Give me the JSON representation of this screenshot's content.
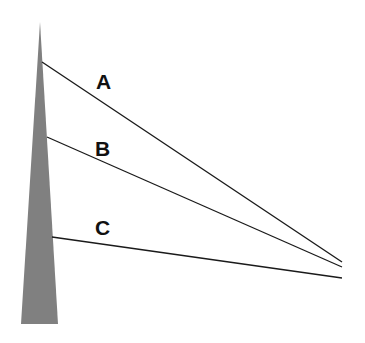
{
  "diagram": {
    "pole": {
      "color": "#808080",
      "top": [
        40,
        22
      ],
      "base_left": [
        21,
        324
      ],
      "base_right": [
        58,
        324
      ]
    },
    "lines": [
      {
        "label": "A",
        "start": [
          42,
          62
        ],
        "end": [
          342,
          262
        ],
        "label_pos": [
          96,
          89
        ]
      },
      {
        "label": "B",
        "start": [
          47,
          137
        ],
        "end": [
          342,
          267
        ],
        "label_pos": [
          95,
          156
        ]
      },
      {
        "label": "C",
        "start": [
          52,
          237
        ],
        "end": [
          342,
          278
        ],
        "label_pos": [
          95,
          235
        ]
      }
    ],
    "line_color": "#1a1a1a"
  }
}
